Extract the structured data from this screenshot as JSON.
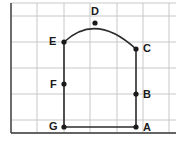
{
  "figure": {
    "type": "geometry-diagram",
    "background_color": "#ffffff",
    "grid": {
      "visible": true,
      "line_color": "#c8c8c8",
      "axis_color": "#3a3a3a",
      "cell_size": 26,
      "vertical_lines_x": [
        11,
        37,
        64,
        90,
        117,
        143,
        169
      ],
      "horizontal_lines_y": [
        3,
        16,
        42,
        68,
        94,
        120,
        133
      ],
      "left_axis_x": 11,
      "bottom_axis_y": 133
    },
    "shape": {
      "stroke_color": "#2b2b2b",
      "stroke_width": 1.6,
      "fill": "none",
      "outline_path": "M 64 42 L 64 127 L 136 127 L 136 49",
      "arc_path": "M 64 42 Q 96 12 136 49",
      "point_radius": 2.6,
      "point_color": "#1a1a1a"
    },
    "points": [
      {
        "id": "A",
        "label": "A",
        "x": 136,
        "y": 127,
        "label_x": 143,
        "label_y": 122,
        "label_side": "right"
      },
      {
        "id": "B",
        "label": "B",
        "x": 136,
        "y": 94,
        "label_x": 143,
        "label_y": 89,
        "label_side": "right"
      },
      {
        "id": "C",
        "label": "C",
        "x": 136,
        "y": 49,
        "label_x": 143,
        "label_y": 43,
        "label_side": "right"
      },
      {
        "id": "D",
        "label": "D",
        "x": 95,
        "y": 23,
        "label_x": 91,
        "label_y": 6,
        "label_side": "above"
      },
      {
        "id": "E",
        "label": "E",
        "x": 64,
        "y": 42,
        "label_x": 49,
        "label_y": 36,
        "label_side": "left"
      },
      {
        "id": "F",
        "label": "F",
        "x": 64,
        "y": 84,
        "label_x": 50,
        "label_y": 79,
        "label_side": "left"
      },
      {
        "id": "G",
        "label": "G",
        "x": 64,
        "y": 127,
        "label_x": 49,
        "label_y": 121,
        "label_side": "left"
      }
    ]
  }
}
